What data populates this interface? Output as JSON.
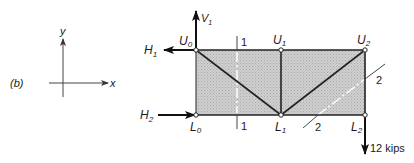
{
  "figure": {
    "panel_label": "(b)",
    "axes": {
      "x_label": "x",
      "y_label": "y"
    }
  },
  "truss": {
    "nodes": [
      {
        "id": "U0",
        "label": "U",
        "sub": "0",
        "x": 196,
        "y": 50
      },
      {
        "id": "U1",
        "label": "U",
        "sub": "1",
        "x": 281,
        "y": 50
      },
      {
        "id": "U2",
        "label": "U",
        "sub": "2",
        "x": 365,
        "y": 50
      },
      {
        "id": "L0",
        "label": "L",
        "sub": "0",
        "x": 196,
        "y": 115
      },
      {
        "id": "L1",
        "label": "L",
        "sub": "1",
        "x": 281,
        "y": 115
      },
      {
        "id": "L2",
        "label": "L",
        "sub": "2",
        "x": 365,
        "y": 115
      }
    ],
    "members": [
      [
        "U0",
        "U1"
      ],
      [
        "U1",
        "U2"
      ],
      [
        "L0",
        "L1"
      ],
      [
        "L1",
        "L2"
      ],
      [
        "U0",
        "L0"
      ],
      [
        "U1",
        "L1"
      ],
      [
        "U2",
        "L2"
      ],
      [
        "U0",
        "L1"
      ],
      [
        "L1",
        "U2"
      ]
    ],
    "fill_color": "#c8c8c8"
  },
  "forces": {
    "V1": {
      "label": "V",
      "sub": "1",
      "direction": "up"
    },
    "H1": {
      "label": "H",
      "sub": "1",
      "direction": "left"
    },
    "H2": {
      "label": "H",
      "sub": "2",
      "direction": "right"
    },
    "load": {
      "label": "12 kips",
      "direction": "down",
      "node": "L2"
    }
  },
  "sections": [
    {
      "id": "section-1",
      "label_top": "1",
      "label_bottom": "1",
      "orientation": "vertical"
    },
    {
      "id": "section-2",
      "label_top": "2",
      "label_bottom": "2",
      "orientation": "diagonal"
    }
  ]
}
